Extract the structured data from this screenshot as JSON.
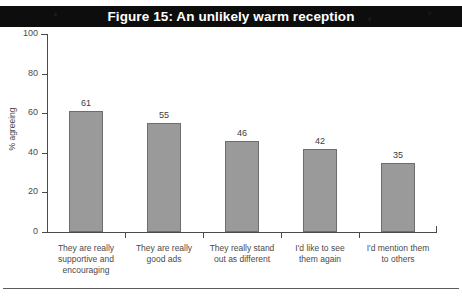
{
  "page": {
    "top_cut_text": "",
    "background_color": "#ffffff",
    "bottom_rule_color": "#5c5c5c"
  },
  "banner": {
    "title": "Figure 15: An unlikely warm reception",
    "background_color": "#0d0d0d",
    "text_color": "#ffffff"
  },
  "chart_data": {
    "type": "bar",
    "title": "Figure 15: An unlikely warm reception",
    "xlabel": "",
    "ylabel": "% agreeing",
    "ylim": [
      0,
      100
    ],
    "yticks": [
      0,
      20,
      40,
      60,
      80,
      100
    ],
    "grid": false,
    "legend": false,
    "bar_color": "#9a9a9a",
    "bar_border_color": "#6d6d6d",
    "categories": [
      "They are really supportive  and encouraging",
      "They are really good ads",
      "They really stand out as different",
      "I'd like to see them again",
      "I'd mention them to others"
    ],
    "category_lines": [
      [
        "They are really",
        "supportive  and",
        "encouraging"
      ],
      [
        "They are really",
        "good ads"
      ],
      [
        "They really stand",
        "out as different"
      ],
      [
        "I'd like to see",
        "them again"
      ],
      [
        "I'd mention them",
        "to others"
      ]
    ],
    "values": [
      61,
      55,
      46,
      42,
      35
    ],
    "value_labels": [
      "61",
      "55",
      "46",
      "42",
      "35"
    ]
  }
}
